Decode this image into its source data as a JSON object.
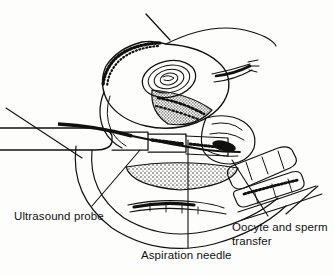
{
  "figure": {
    "background_color": "#fdfdfc",
    "ink_color": "#101010",
    "style": "pen-and-ink line drawing with stipple and hatch shading"
  },
  "labels": {
    "ultrasound_probe": "Ultrasound probe",
    "aspiration_needle": "Aspiration needle",
    "oocyte_and_sperm_transfer": "Oocyte and sperm\ntransfer"
  },
  "anatomy": {
    "uterus": "uterus body with stippled endometrial border",
    "follicle": "ovarian follicle shown as concentric oval rings",
    "ovary": "stippled elongated ovary",
    "bladder": "stippled elongated bladder",
    "vaginal_wall": "nested arc contours of pelvic outline",
    "probe_shaft": "ultrasound probe shaft entering from left edge",
    "needle": "aspiration needle along probe shaft",
    "catheter": "segmented transfer catheter at lower right"
  },
  "leader_lines": {
    "ultrasound_probe": "from label up-right to probe shaft",
    "aspiration_needle": "vertical line from label up to needle",
    "oocyte_and_sperm_transfer": "diagonal line up-left to catheter tip"
  }
}
